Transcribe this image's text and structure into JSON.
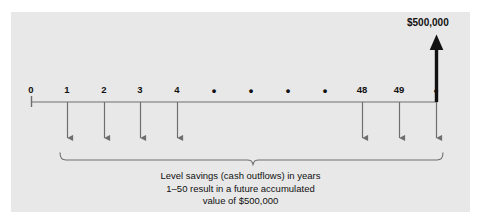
{
  "figure": {
    "type": "timeline-cash-flow-diagram",
    "background_color": "#ffffff",
    "panel_color": "#e8e8e8",
    "line_color": "#555555",
    "accent_color": "#000000"
  },
  "timeline": {
    "axis_label": "",
    "ticks": [
      {
        "label": "0",
        "x": 31,
        "kind": "origin",
        "outflow": false
      },
      {
        "label": "1",
        "x": 67,
        "kind": "year",
        "outflow": true
      },
      {
        "label": "2",
        "x": 104,
        "kind": "year",
        "outflow": true
      },
      {
        "label": "3",
        "x": 140,
        "kind": "year",
        "outflow": true
      },
      {
        "label": "4",
        "x": 177,
        "kind": "year",
        "outflow": true
      },
      {
        "label": "•",
        "x": 214,
        "kind": "ellipsis",
        "outflow": false
      },
      {
        "label": "•",
        "x": 251,
        "kind": "ellipsis",
        "outflow": false
      },
      {
        "label": "•",
        "x": 288,
        "kind": "ellipsis",
        "outflow": false
      },
      {
        "label": "•",
        "x": 325,
        "kind": "ellipsis",
        "outflow": false
      },
      {
        "label": "48",
        "x": 362,
        "kind": "year",
        "outflow": true
      },
      {
        "label": "49",
        "x": 399,
        "kind": "year",
        "outflow": true
      },
      {
        "label": "•",
        "x": 436,
        "kind": "ellipsis",
        "outflow": true
      }
    ]
  },
  "future_value": {
    "label": "$500,000",
    "x": 436,
    "direction": "inflow-up"
  },
  "brace": {
    "left_x": 60,
    "right_x": 443,
    "center_x": 253
  },
  "caption": {
    "line1": "Level savings (cash outflows) in years",
    "line2": "1–50 result in a future accumulated",
    "line3": "value of $500,000"
  }
}
